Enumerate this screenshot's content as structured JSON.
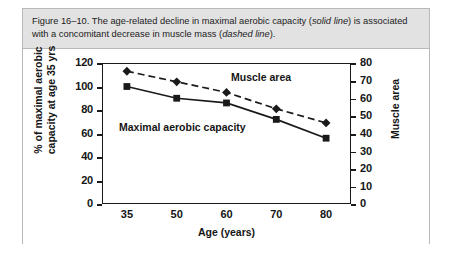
{
  "caption": {
    "prefix": "Figure 16–10. The age-related decline in maximal aerobic capacity (",
    "emphasis_1": "solid line",
    "middle": ") is associated with a concomitant decrease in muscle mass (",
    "emphasis_2": "dashed line",
    "suffix": ")."
  },
  "chart_data": {
    "type": "line",
    "title": "",
    "xlabel": "Age (years)",
    "ylabel": "% of maximal aerobic capacity at age 35 yrs",
    "y2label": "Muscle area",
    "categories": [
      "35",
      "50",
      "60",
      "70",
      "80"
    ],
    "x": [
      35,
      50,
      60,
      70,
      80
    ],
    "ylim": [
      0,
      120
    ],
    "yticks": [
      "0",
      "20",
      "40",
      "60",
      "80",
      "100",
      "120"
    ],
    "y2lim": [
      0,
      80
    ],
    "y2ticks": [
      "0",
      "10",
      "20",
      "30",
      "40",
      "50",
      "60",
      "70",
      "80"
    ],
    "grid": false,
    "legend_position": "inline-annotations",
    "series": [
      {
        "name": "Maximal aerobic capacity",
        "axis": "left",
        "style": "solid",
        "marker": "square",
        "color": "#1a1a1a",
        "values": [
          100,
          90,
          86,
          72,
          56
        ]
      },
      {
        "name": "Muscle area",
        "axis": "left",
        "style": "dashed",
        "marker": "diamond",
        "color": "#1a1a1a",
        "values": [
          113,
          104,
          95,
          81,
          69
        ]
      }
    ],
    "annotations": [
      {
        "text": "Muscle area",
        "x": 60,
        "y": 117
      },
      {
        "text": "Maximal aerobic capacity",
        "x": 38,
        "y": 80
      }
    ]
  },
  "colors": {
    "caption_background": "#e2e2e2",
    "border": "#b9b9b9",
    "axis": "#1a1a1a",
    "text": "#151515",
    "plot_background": "#ffffff"
  }
}
